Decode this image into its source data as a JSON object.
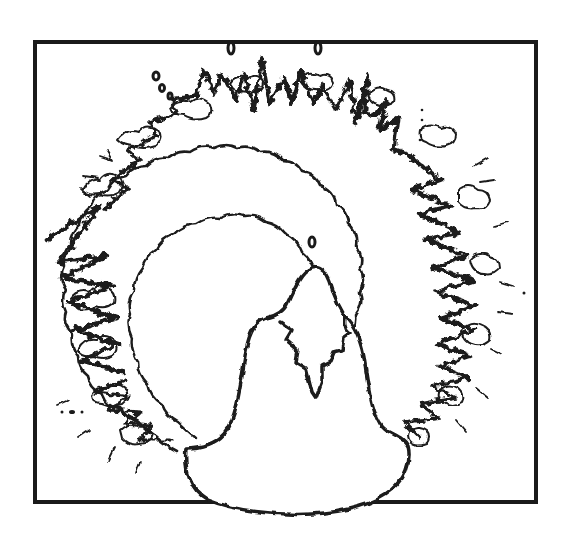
{
  "illustration": {
    "subject": "line drawing of a mountain peak encircled by a ring of billowing clouds inside a rectangular frame",
    "style": "black ink line art on white",
    "colors": {
      "ink": "#1a1a1a",
      "paper": "#ffffff"
    },
    "frame": {
      "x": 35,
      "y": 42,
      "width": 501,
      "height": 460
    },
    "elements": [
      "rectangular-frame",
      "cloud-ring",
      "mountain",
      "snow-cap",
      "small-oval-above-peak",
      "two-small-ovals-on-top-edge"
    ]
  }
}
